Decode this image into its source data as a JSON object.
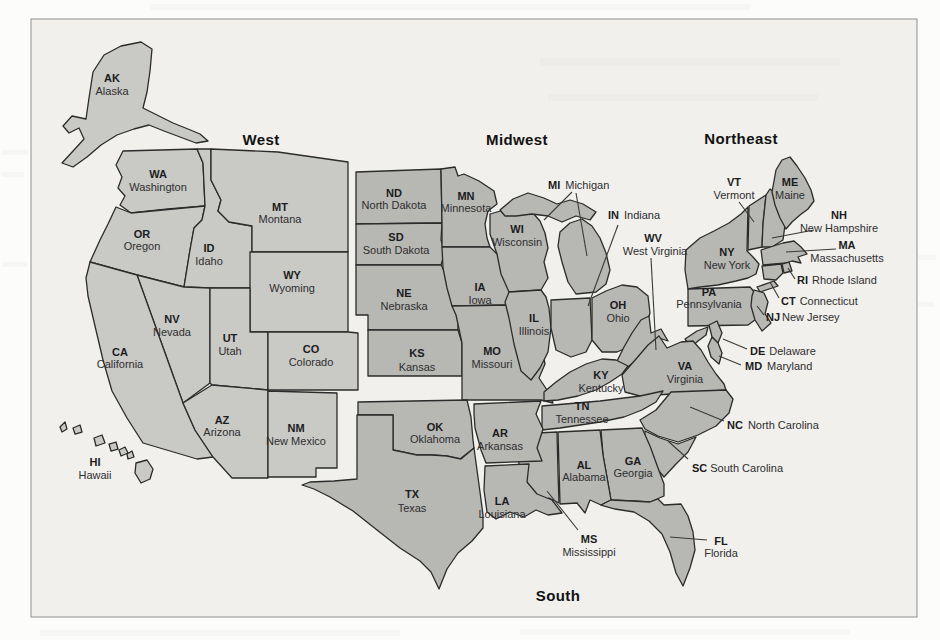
{
  "page": {
    "background": "#fcfcfb"
  },
  "figure": {
    "kind": "us-census-regions-map",
    "region_titles": {
      "west": "West",
      "midwest": "Midwest",
      "northeast": "Northeast",
      "south": "South"
    },
    "palette": {
      "west_fill": "#c9c9c6",
      "other_fill": "#b7b7b4",
      "state_outline": "#2b2b2b",
      "label_color": "#1c1c1c",
      "callout_line": "#3a3a3a",
      "figure_background": "#f1f0ed",
      "figure_border": "#8f8f8f"
    },
    "states": {
      "ak": {
        "abbr": "AK",
        "name": "Alaska",
        "region": "West"
      },
      "hi": {
        "abbr": "HI",
        "name": "Hawaii",
        "region": "West"
      },
      "wa": {
        "abbr": "WA",
        "name": "Washington",
        "region": "West"
      },
      "or": {
        "abbr": "OR",
        "name": "Oregon",
        "region": "West"
      },
      "id": {
        "abbr": "ID",
        "name": "Idaho",
        "region": "West"
      },
      "mt": {
        "abbr": "MT",
        "name": "Montana",
        "region": "West"
      },
      "wy": {
        "abbr": "WY",
        "name": "Wyoming",
        "region": "West"
      },
      "nv": {
        "abbr": "NV",
        "name": "Nevada",
        "region": "West"
      },
      "ut": {
        "abbr": "UT",
        "name": "Utah",
        "region": "West"
      },
      "ca": {
        "abbr": "CA",
        "name": "California",
        "region": "West"
      },
      "co": {
        "abbr": "CO",
        "name": "Colorado",
        "region": "West"
      },
      "az": {
        "abbr": "AZ",
        "name": "Arizona",
        "region": "West"
      },
      "nm": {
        "abbr": "NM",
        "name": "New Mexico",
        "region": "West"
      },
      "nd": {
        "abbr": "ND",
        "name": "North Dakota",
        "region": "Midwest"
      },
      "sd": {
        "abbr": "SD",
        "name": "South Dakota",
        "region": "Midwest"
      },
      "ne": {
        "abbr": "NE",
        "name": "Nebraska",
        "region": "Midwest"
      },
      "ks": {
        "abbr": "KS",
        "name": "Kansas",
        "region": "Midwest"
      },
      "mn": {
        "abbr": "MN",
        "name": "Minnesota",
        "region": "Midwest"
      },
      "ia": {
        "abbr": "IA",
        "name": "Iowa",
        "region": "Midwest"
      },
      "mo": {
        "abbr": "MO",
        "name": "Missouri",
        "region": "Midwest"
      },
      "wi": {
        "abbr": "WI",
        "name": "Wisconsin",
        "region": "Midwest"
      },
      "il": {
        "abbr": "IL",
        "name": "Illinois",
        "region": "Midwest"
      },
      "mi": {
        "abbr": "MI",
        "name": "Michigan",
        "region": "Midwest"
      },
      "in": {
        "abbr": "IN",
        "name": "Indiana",
        "region": "Midwest"
      },
      "oh": {
        "abbr": "OH",
        "name": "Ohio",
        "region": "Midwest"
      },
      "me": {
        "abbr": "ME",
        "name": "Maine",
        "region": "Northeast"
      },
      "vt": {
        "abbr": "VT",
        "name": "Vermont",
        "region": "Northeast"
      },
      "nh": {
        "abbr": "NH",
        "name": "New Hampshire",
        "region": "Northeast"
      },
      "ma": {
        "abbr": "MA",
        "name": "Massachusetts",
        "region": "Northeast"
      },
      "ri": {
        "abbr": "RI",
        "name": "Rhode Island",
        "region": "Northeast"
      },
      "ct": {
        "abbr": "CT",
        "name": "Connecticut",
        "region": "Northeast"
      },
      "ny": {
        "abbr": "NY",
        "name": "New York",
        "region": "Northeast"
      },
      "pa": {
        "abbr": "PA",
        "name": "Pennsylvania",
        "region": "Northeast"
      },
      "nj": {
        "abbr": "NJ",
        "name": "New Jersey",
        "region": "Northeast"
      },
      "de": {
        "abbr": "DE",
        "name": "Delaware",
        "region": "South"
      },
      "md": {
        "abbr": "MD",
        "name": "Maryland",
        "region": "South"
      },
      "wv": {
        "abbr": "WV",
        "name": "West Virginia",
        "region": "South"
      },
      "va": {
        "abbr": "VA",
        "name": "Virginia",
        "region": "South"
      },
      "ky": {
        "abbr": "KY",
        "name": "Kentucky",
        "region": "South"
      },
      "tn": {
        "abbr": "TN",
        "name": "Tennessee",
        "region": "South"
      },
      "nc": {
        "abbr": "NC",
        "name": "North Carolina",
        "region": "South"
      },
      "sc": {
        "abbr": "SC",
        "name": "South Carolina",
        "region": "South"
      },
      "ga": {
        "abbr": "GA",
        "name": "Georgia",
        "region": "South"
      },
      "al": {
        "abbr": "AL",
        "name": "Alabama",
        "region": "South"
      },
      "ms": {
        "abbr": "MS",
        "name": "Mississippi",
        "region": "South"
      },
      "ar": {
        "abbr": "AR",
        "name": "Arkansas",
        "region": "South"
      },
      "la": {
        "abbr": "LA",
        "name": "Louisiana",
        "region": "South"
      },
      "ok": {
        "abbr": "OK",
        "name": "Oklahoma",
        "region": "South"
      },
      "tx": {
        "abbr": "TX",
        "name": "Texas",
        "region": "South"
      },
      "fl": {
        "abbr": "FL",
        "name": "Florida",
        "region": "South"
      }
    }
  }
}
